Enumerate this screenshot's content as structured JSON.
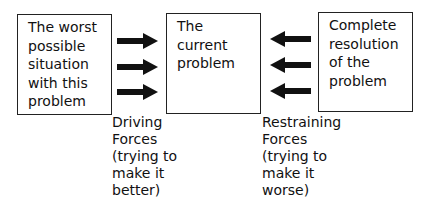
{
  "diagram": {
    "type": "force-field-analysis",
    "boxes": [
      {
        "id": "worst",
        "lines": [
          "The worst",
          "possible",
          "situation",
          "with this",
          "problem"
        ]
      },
      {
        "id": "current",
        "lines": [
          "The",
          "current",
          "problem"
        ]
      },
      {
        "id": "resolution",
        "lines": [
          "Complete",
          "resolution",
          "of the",
          "problem"
        ]
      }
    ],
    "driving_forces": {
      "direction": "right",
      "count": 3,
      "label_lines": [
        "Driving",
        "Forces",
        "(trying to",
        "make it",
        "better)"
      ]
    },
    "restraining_forces": {
      "direction": "left",
      "count": 3,
      "label_lines": [
        "Restraining",
        "Forces",
        "(trying to",
        "make it",
        "worse)"
      ]
    },
    "colors": {
      "stroke": "#222222",
      "arrow": "#111111",
      "background": "#ffffff"
    }
  }
}
